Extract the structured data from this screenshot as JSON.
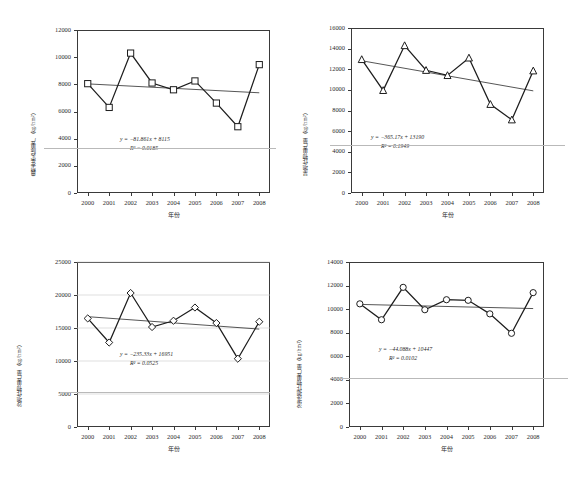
{
  "figure": {
    "background": "#ffffff",
    "ink": "#1d1d1a",
    "panel_count": 4
  },
  "common": {
    "xlabel": "年份",
    "years": [
      "2000",
      "2001",
      "2002",
      "2003",
      "2004",
      "2005",
      "2006",
      "2007",
      "2008"
    ],
    "unit": "(kg/hm²)"
  },
  "chart_data": [
    {
      "id": "panel-top-left",
      "type": "line",
      "title": "",
      "xlabel": "年份",
      "ylabel": "典型年实际单产（kg/hm²）",
      "categories": [
        "2000",
        "2001",
        "2002",
        "2003",
        "2004",
        "2005",
        "2006",
        "2007",
        "2008"
      ],
      "series": [
        {
          "name": "实际单产",
          "marker": "square",
          "values": [
            8050,
            6300,
            10300,
            8100,
            7600,
            8250,
            6620,
            4880,
            9450
          ]
        }
      ],
      "trend": {
        "equation": "y = −81.861x + 8115",
        "r2": "R² = 0.0185",
        "slope": -81.861,
        "intercept": 8115,
        "start_value": 8033,
        "end_value": 7378
      },
      "ylim": [
        0,
        12000
      ],
      "yticks": [
        0,
        2000,
        4000,
        6000,
        8000,
        10000,
        12000
      ],
      "grid": false,
      "legend": "none"
    },
    {
      "id": "panel-top-right",
      "type": "line",
      "title": "",
      "xlabel": "年份",
      "ylabel": "旱地作物单产量（kg/hm²）",
      "categories": [
        "2000",
        "2001",
        "2002",
        "2003",
        "2004",
        "2005",
        "2006",
        "2007",
        "2008"
      ],
      "series": [
        {
          "name": "旱地单产",
          "marker": "triangle",
          "values": [
            12950,
            9950,
            14300,
            11900,
            11400,
            13100,
            8600,
            7100,
            11850
          ]
        }
      ],
      "trend": {
        "equation": "y = −365.17x + 13190",
        "r2": "R² = 0.1949",
        "slope": -365.17,
        "intercept": 13190,
        "start_value": 12825,
        "end_value": 9904
      },
      "ylim": [
        0,
        16000
      ],
      "yticks": [
        0,
        2000,
        4000,
        6000,
        8000,
        10000,
        12000,
        14000,
        16000
      ],
      "grid": false,
      "legend": "none"
    },
    {
      "id": "panel-bottom-left",
      "type": "line",
      "title": "",
      "xlabel": "年份",
      "ylabel": "沙地作物单产量（kg/hm²）",
      "categories": [
        "2000",
        "2001",
        "2002",
        "2003",
        "2004",
        "2005",
        "2006",
        "2007",
        "2008"
      ],
      "series": [
        {
          "name": "沙地单产",
          "marker": "diamond",
          "values": [
            16450,
            12800,
            20300,
            15150,
            16100,
            18100,
            15750,
            10350,
            15950
          ]
        }
      ],
      "trend": {
        "equation": "y = −235.33x + 16951",
        "r2": "R² = 0.0525",
        "slope": -235.33,
        "intercept": 16951,
        "start_value": 16716,
        "end_value": 14833
      },
      "ylim": [
        0,
        25000
      ],
      "yticks": [
        0,
        5000,
        10000,
        15000,
        20000,
        25000
      ],
      "grid": true,
      "legend": "none"
    },
    {
      "id": "panel-bottom-right",
      "type": "line",
      "title": "",
      "xlabel": "年份",
      "ylabel": "滨淮地作物单产量（kg/hm²）",
      "categories": [
        "2000",
        "2001",
        "2002",
        "2003",
        "2004",
        "2005",
        "2006",
        "2007",
        "2008"
      ],
      "series": [
        {
          "name": "滨淮地单产",
          "marker": "circle",
          "values": [
            10450,
            9100,
            11850,
            9950,
            10800,
            10750,
            9600,
            7950,
            11400
          ]
        }
      ],
      "trend": {
        "equation": "y = −44.088x + 10447",
        "r2": "R² = 0.0102",
        "slope": -44.088,
        "intercept": 10447,
        "start_value": 10403,
        "end_value": 10050
      },
      "ylim": [
        0,
        14000
      ],
      "yticks": [
        0,
        2000,
        4000,
        6000,
        8000,
        10000,
        12000,
        14000
      ],
      "grid": false,
      "legend": "none"
    }
  ]
}
